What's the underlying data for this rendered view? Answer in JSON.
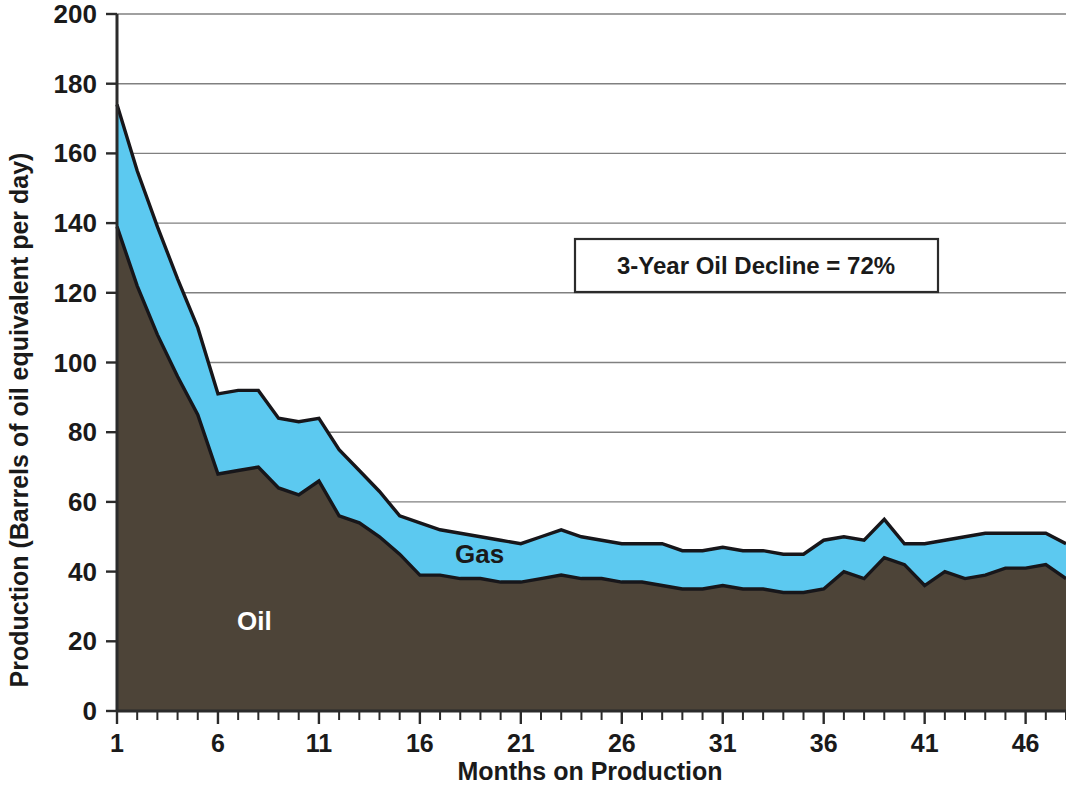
{
  "chart_data": {
    "type": "area",
    "stacked": true,
    "title": "",
    "xlabel": "Months on Production",
    "ylabel": "Production (Barrels of oil equivalent per day)",
    "xlim": [
      1,
      48
    ],
    "ylim": [
      0,
      200
    ],
    "ytick_step": 20,
    "yticks": [
      0,
      20,
      40,
      60,
      80,
      100,
      120,
      140,
      160,
      180,
      200
    ],
    "xticks_labeled": [
      1,
      6,
      11,
      16,
      21,
      26,
      31,
      36,
      41,
      46
    ],
    "xtick_minor_step": 1,
    "grid": "horizontal",
    "legend_position": "inline-on-areas",
    "annotations": [
      {
        "name": "decline-callout",
        "text": "3-Year Oil Decline = 72%",
        "x_month": 25,
        "y_value": 126
      }
    ],
    "colors": {
      "oil": "#4d4438",
      "gas": "#5cc9f0",
      "outline": "#17161a",
      "grid": "#808080",
      "axis": "#2b2b2b",
      "background": "#ffffff",
      "oil_label_text": "#ffffff",
      "gas_label_text": "#1a1a1a"
    },
    "x": [
      1,
      2,
      3,
      4,
      5,
      6,
      7,
      8,
      9,
      10,
      11,
      12,
      13,
      14,
      15,
      16,
      17,
      18,
      19,
      20,
      21,
      22,
      23,
      24,
      25,
      26,
      27,
      28,
      29,
      30,
      31,
      32,
      33,
      34,
      35,
      36,
      37,
      38,
      39,
      40,
      41,
      42,
      43,
      44,
      45,
      46,
      47,
      48
    ],
    "series": [
      {
        "name": "Oil",
        "label": "Oil",
        "color": "#4d4438",
        "values": [
          139,
          122,
          108,
          96,
          85,
          68,
          69,
          70,
          64,
          62,
          66,
          56,
          54,
          50,
          45,
          39,
          39,
          38,
          38,
          37,
          37,
          38,
          39,
          38,
          38,
          37,
          37,
          36,
          35,
          35,
          36,
          35,
          35,
          34,
          34,
          35,
          40,
          38,
          44,
          42,
          36,
          40,
          38,
          39,
          41,
          41,
          42,
          38
        ]
      },
      {
        "name": "Gas",
        "label": "Gas",
        "color": "#5cc9f0",
        "values": [
          35,
          33,
          31,
          28,
          25,
          23,
          23,
          22,
          20,
          21,
          18,
          19,
          15,
          13,
          11,
          15,
          13,
          13,
          12,
          12,
          11,
          12,
          13,
          12,
          11,
          11,
          11,
          12,
          11,
          11,
          11,
          11,
          11,
          11,
          11,
          14,
          10,
          11,
          11,
          6,
          12,
          9,
          12,
          12,
          10,
          10,
          9,
          10
        ]
      }
    ],
    "totals": [
      174,
      155,
      139,
      124,
      110,
      91,
      92,
      92,
      84,
      83,
      84,
      75,
      69,
      63,
      56,
      54,
      52,
      51,
      50,
      49,
      48,
      50,
      52,
      50,
      49,
      48,
      48,
      48,
      46,
      46,
      47,
      46,
      46,
      45,
      45,
      49,
      50,
      49,
      55,
      48,
      48,
      49,
      50,
      51,
      51,
      51,
      51,
      48
    ]
  },
  "axes": {
    "y_title": "Production (Barrels of oil equivalent per day)",
    "x_title": "Months on Production",
    "y_tick_labels": [
      "200",
      "180",
      "160",
      "140",
      "120",
      "100",
      "80",
      "60",
      "40",
      "20",
      "0"
    ],
    "x_tick_labels": [
      "1",
      "6",
      "11",
      "16",
      "21",
      "26",
      "31",
      "36",
      "41",
      "46"
    ]
  },
  "labels": {
    "oil": "Oil",
    "gas": "Gas"
  },
  "callout": {
    "text": "3-Year Oil Decline = 72%"
  }
}
